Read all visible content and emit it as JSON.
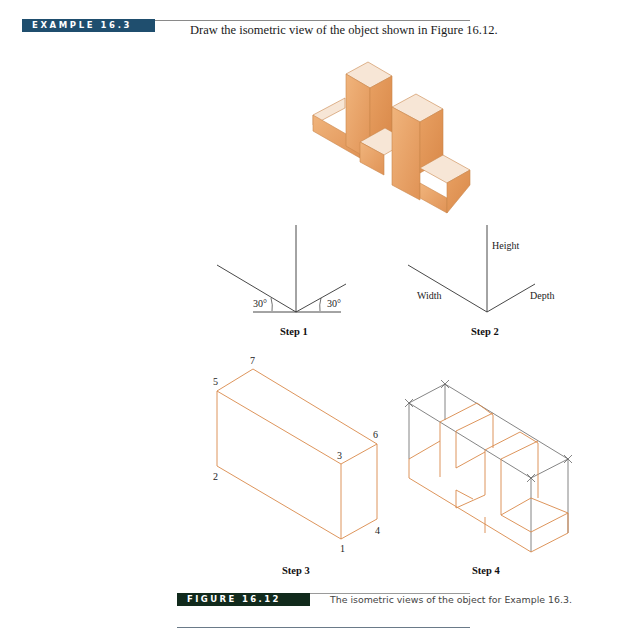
{
  "example": {
    "tag": "EXAMPLE 16.3",
    "prompt": "Draw the isometric view of the object shown in Figure 16.12."
  },
  "figure": {
    "tag": "FIGURE 16.12",
    "caption": "The isometric views of the object for Example 16.3."
  },
  "steps": [
    {
      "label": "Step 1",
      "angles": [
        "30°",
        "30°"
      ]
    },
    {
      "label": "Step 2",
      "axes": {
        "height": "Height",
        "width": "Width",
        "depth": "Depth"
      }
    },
    {
      "label": "Step 3",
      "vertices": [
        "1",
        "2",
        "3",
        "4",
        "5",
        "6",
        "7"
      ]
    },
    {
      "label": "Step 4"
    }
  ],
  "colors": {
    "example_tag_bg": "#1f4e6e",
    "figure_tag_bg": "#112a1c",
    "object_fill": "#e8a468",
    "construction_line": "#555555",
    "object_line": "#d98a4a"
  }
}
